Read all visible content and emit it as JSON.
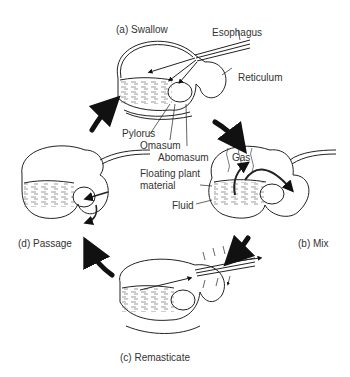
{
  "figure": {
    "stages": [
      {
        "id": "a",
        "label": "(a) Swallow"
      },
      {
        "id": "b",
        "label": "(b) Mix"
      },
      {
        "id": "c",
        "label": "(c) Remasticate"
      },
      {
        "id": "d",
        "label": "(d) Passage"
      }
    ],
    "anatomy_labels": {
      "esophagus": "Esophagus",
      "reticulum": "Reticulum",
      "pylorus": "Pylorus",
      "omasum": "Omasum",
      "abomasum": "Abomasum",
      "floating_plant_material_line1": "Floating plant",
      "floating_plant_material_line2": "material",
      "fluid": "Fluid",
      "gas": "Gas"
    },
    "colors": {
      "line": "#222222",
      "background": "#ffffff"
    }
  }
}
